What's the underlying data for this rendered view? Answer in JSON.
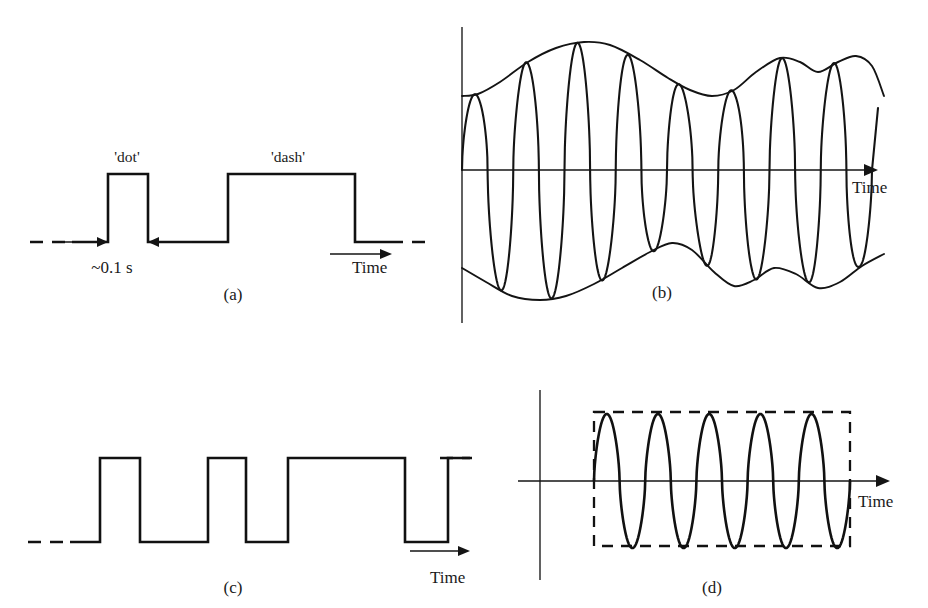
{
  "figure": {
    "width": 928,
    "height": 608,
    "background": "#ffffff",
    "ink_color": "#111111",
    "axis_color": "#3a3a3a"
  },
  "panels": [
    {
      "id": "a",
      "caption": "(a)",
      "caption_x": 233,
      "caption_y": 285,
      "kind": "square-pulse-train",
      "axis_title": "Time",
      "axis_title_x": 352,
      "axis_title_y": 258,
      "annotations": [
        {
          "name": "dot-label",
          "text": "'dot'",
          "x": 127,
          "y": 148
        },
        {
          "name": "dash-label",
          "text": "'dash'",
          "x": 288,
          "y": 148
        },
        {
          "name": "duration-label",
          "text": "~0.1 s",
          "x": 112,
          "y": 258
        }
      ]
    },
    {
      "id": "b",
      "caption": "(b)",
      "caption_x": 662,
      "caption_y": 283,
      "kind": "amplitude-modulated-carrier",
      "axis_title": "Time",
      "axis_title_x": 852,
      "axis_title_y": 178
    },
    {
      "id": "c",
      "caption": "(c)",
      "caption_x": 233,
      "caption_y": 578,
      "kind": "digital-pulse-train",
      "axis_title": "Time",
      "axis_title_x": 430,
      "axis_title_y": 568
    },
    {
      "id": "d",
      "caption": "(d)",
      "caption_x": 712,
      "caption_y": 578,
      "kind": "gated-sine-burst",
      "axis_title": "Time",
      "axis_title_x": 858,
      "axis_title_y": 492
    }
  ],
  "chart_data": [
    {
      "type": "line",
      "panel": "a",
      "title": "Morse keying waveform",
      "xlabel": "Time",
      "ylabel": "",
      "notes": "Binary on/off keying: one short 'dot' pulse then one long 'dash' pulse; dashed leads at both ends indicate the signal continues.",
      "levels": {
        "low": 0,
        "high": 1
      },
      "baseline_y": 242,
      "high_y": 174,
      "lead_in_dashed": {
        "x1": 30,
        "x2": 72
      },
      "lead_out_dashed": {
        "x1": 390,
        "x2": 432
      },
      "segments": [
        {
          "label": "idle",
          "level": 0,
          "x1": 72,
          "x2": 108
        },
        {
          "label": "dot",
          "level": 1,
          "x1": 108,
          "x2": 148
        },
        {
          "label": "gap",
          "level": 0,
          "x1": 148,
          "x2": 228
        },
        {
          "label": "dash",
          "level": 1,
          "x1": 228,
          "x2": 355
        },
        {
          "label": "idle",
          "level": 0,
          "x1": 355,
          "x2": 390
        }
      ],
      "measure_arrows": [
        {
          "name": "left-duration-arrow",
          "direction": "right",
          "x1": 62,
          "x2": 108,
          "y": 242
        },
        {
          "name": "right-duration-arrow",
          "direction": "left",
          "x1": 192,
          "x2": 148,
          "y": 242
        }
      ],
      "time_arrow": {
        "x1": 330,
        "x2": 392,
        "y": 242
      }
    },
    {
      "type": "line",
      "panel": "b",
      "title": "Amplitude-modulated carrier with envelope",
      "xlabel": "Time",
      "ylabel": "",
      "notes": "High-frequency carrier whose peak amplitude traces an irregular modulating envelope above and below the time axis.",
      "axis": {
        "x_axis_y": 170,
        "x_axis_x1": 462,
        "x_axis_x2": 878,
        "y_axis_x": 462,
        "y_axis_y1": 27,
        "y_axis_y2": 323
      },
      "carrier_cycles": 8,
      "carrier_x_start": 462,
      "carrier_x_end": 872,
      "envelope_upper": [
        {
          "x": 462,
          "y": 96
        },
        {
          "x": 478,
          "y": 94
        },
        {
          "x": 500,
          "y": 82
        },
        {
          "x": 528,
          "y": 62
        },
        {
          "x": 556,
          "y": 48
        },
        {
          "x": 584,
          "y": 42
        },
        {
          "x": 610,
          "y": 45
        },
        {
          "x": 640,
          "y": 60
        },
        {
          "x": 668,
          "y": 78
        },
        {
          "x": 690,
          "y": 90
        },
        {
          "x": 712,
          "y": 96
        },
        {
          "x": 734,
          "y": 90
        },
        {
          "x": 756,
          "y": 72
        },
        {
          "x": 780,
          "y": 58
        },
        {
          "x": 800,
          "y": 62
        },
        {
          "x": 818,
          "y": 72
        },
        {
          "x": 838,
          "y": 62
        },
        {
          "x": 856,
          "y": 56
        },
        {
          "x": 872,
          "y": 66
        },
        {
          "x": 884,
          "y": 96
        }
      ],
      "envelope_lower": [
        {
          "x": 462,
          "y": 268
        },
        {
          "x": 486,
          "y": 282
        },
        {
          "x": 512,
          "y": 296
        },
        {
          "x": 540,
          "y": 300
        },
        {
          "x": 566,
          "y": 296
        },
        {
          "x": 594,
          "y": 284
        },
        {
          "x": 622,
          "y": 268
        },
        {
          "x": 650,
          "y": 252
        },
        {
          "x": 672,
          "y": 243
        },
        {
          "x": 692,
          "y": 250
        },
        {
          "x": 714,
          "y": 272
        },
        {
          "x": 734,
          "y": 286
        },
        {
          "x": 754,
          "y": 280
        },
        {
          "x": 774,
          "y": 268
        },
        {
          "x": 796,
          "y": 274
        },
        {
          "x": 818,
          "y": 288
        },
        {
          "x": 840,
          "y": 282
        },
        {
          "x": 862,
          "y": 266
        },
        {
          "x": 884,
          "y": 254
        }
      ],
      "time_arrow": {
        "x1": 462,
        "x2": 878,
        "y": 170
      }
    },
    {
      "type": "line",
      "panel": "c",
      "title": "Digital pulse train",
      "xlabel": "Time",
      "ylabel": "",
      "notes": "Binary data stream of unequal-width high and low intervals; dashed leads at both ends indicate continuation.",
      "levels": {
        "low": 0,
        "high": 1
      },
      "baseline_y": 542,
      "high_y": 458,
      "lead_in_dashed": {
        "x1": 28,
        "x2": 70
      },
      "lead_out_dashed": {
        "x1": 440,
        "x2": 470
      },
      "segments": [
        {
          "label": "low",
          "level": 0,
          "x1": 70,
          "x2": 100
        },
        {
          "label": "high",
          "level": 1,
          "x1": 100,
          "x2": 140
        },
        {
          "label": "low",
          "level": 0,
          "x1": 140,
          "x2": 208
        },
        {
          "label": "high",
          "level": 1,
          "x1": 208,
          "x2": 246
        },
        {
          "label": "low",
          "level": 0,
          "x1": 246,
          "x2": 288
        },
        {
          "label": "high",
          "level": 1,
          "x1": 288,
          "x2": 405
        },
        {
          "label": "low",
          "level": 0,
          "x1": 405,
          "x2": 448
        },
        {
          "label": "high",
          "level": 1,
          "x1": 448,
          "x2": 472
        }
      ],
      "time_arrow": {
        "x1": 410,
        "x2": 470,
        "y": 551
      }
    },
    {
      "type": "line",
      "panel": "d",
      "title": "Gated sine-wave burst",
      "xlabel": "Time",
      "ylabel": "",
      "notes": "Constant-amplitude sinusoid switched on for a finite interval, shown by the dashed rectangular gate outlining the burst.",
      "axis": {
        "x_axis_y": 481,
        "x_axis_x1": 518,
        "x_axis_x2": 890,
        "y_axis_x": 540,
        "y_axis_y1": 390,
        "y_axis_y2": 580
      },
      "gate_box": {
        "x": 594,
        "y": 412,
        "width": 256,
        "height": 134
      },
      "cycles": 5,
      "amplitude": 67,
      "burst_x_start": 594,
      "burst_x_end": 850,
      "time_arrow": {
        "x1": 518,
        "x2": 890,
        "y": 481
      }
    }
  ]
}
